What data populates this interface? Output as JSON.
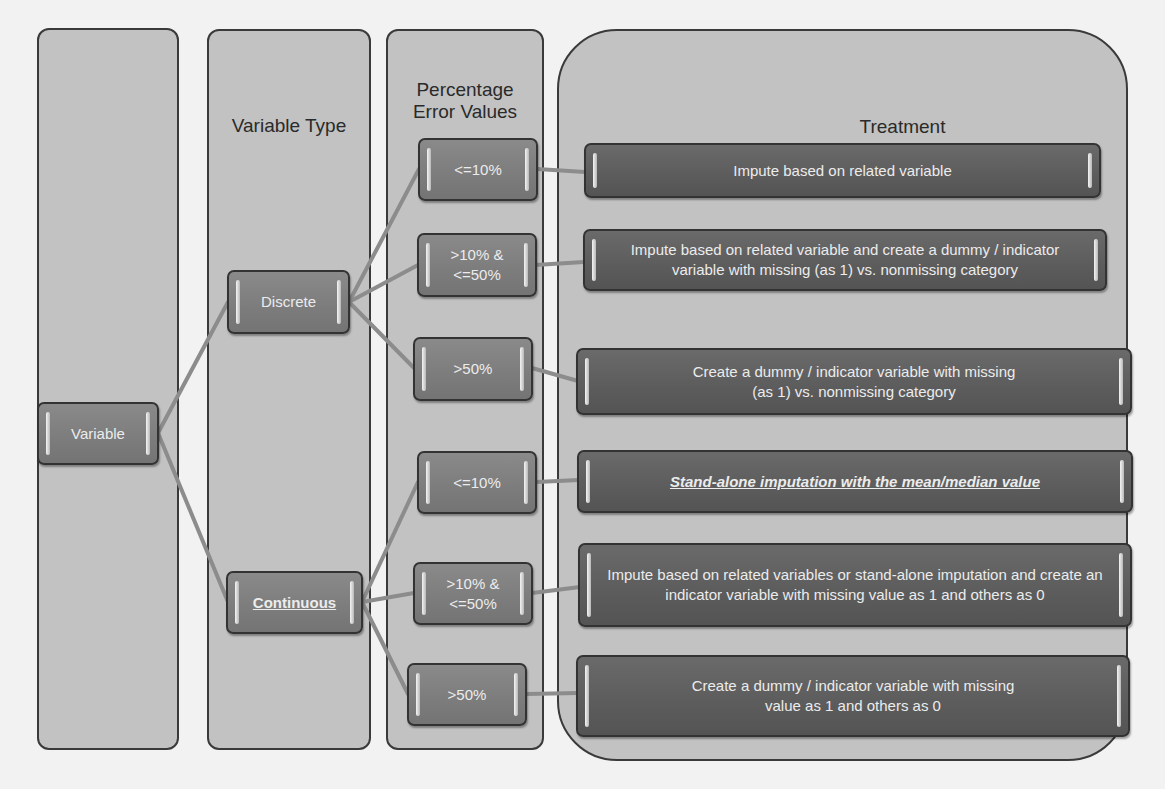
{
  "columns": {
    "variable": {
      "title": ""
    },
    "variable_type": {
      "title": "Variable Type"
    },
    "percentage": {
      "title_line1": "Percentage",
      "title_line2": "Error Values"
    },
    "treatment": {
      "title": "Treatment"
    }
  },
  "root": {
    "label": "Variable"
  },
  "types": [
    {
      "label": "Discrete",
      "underlined": false
    },
    {
      "label": "Continuous",
      "underlined": true
    }
  ],
  "discrete_ranges": [
    {
      "line1": "<=10%",
      "line2": ""
    },
    {
      "line1": ">10% &",
      "line2": "<=50%"
    },
    {
      "line1": ">50%",
      "line2": ""
    }
  ],
  "continuous_ranges": [
    {
      "line1": "<=10%",
      "line2": ""
    },
    {
      "line1": ">10% &",
      "line2": "<=50%"
    },
    {
      "line1": ">50%",
      "line2": ""
    }
  ],
  "treatments": [
    {
      "text": "Impute based on related variable"
    },
    {
      "text": "Impute based on related variable and create a dummy / indicator variable with missing (as 1) vs. nonmissing category"
    },
    {
      "text": "Create a dummy / indicator variable with missing (as 1) vs. nonmissing category"
    },
    {
      "text": "Stand-alone imputation with the mean/median value",
      "emphasis": "bold-italic-underline"
    },
    {
      "text": "Impute based on related variables or stand-alone imputation and create an indicator variable with missing value as 1 and others as 0"
    },
    {
      "text": "Create a dummy / indicator variable with missing value as 1 and others as 0"
    }
  ],
  "colors": {
    "background": "#f2f2f2",
    "panel": "#c2c2c2",
    "box": "#7c7c7c",
    "treatment_box": "#5c5c5c",
    "connector": "#8c8c8c",
    "border": "#333333"
  }
}
